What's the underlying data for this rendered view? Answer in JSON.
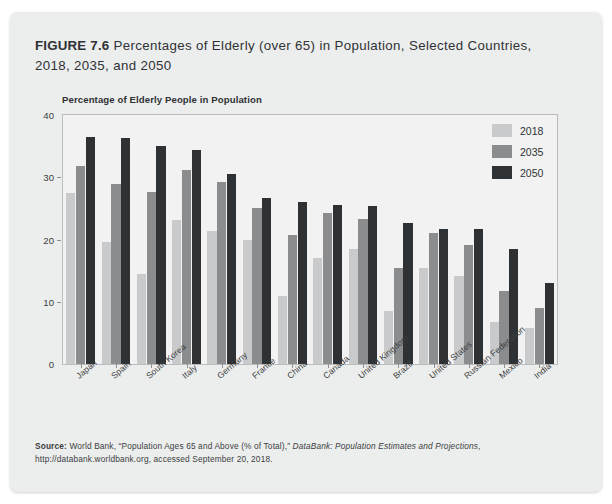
{
  "figure": {
    "label": "FIGURE 7.6",
    "title": " Percentages of Elderly (over 65) in Population, Selected Countries, 2018, 2035, and 2050"
  },
  "legend": {
    "position": "top-right",
    "entries": [
      {
        "label": "2018",
        "color": "#c9cacb"
      },
      {
        "label": "2035",
        "color": "#8a8c8e"
      },
      {
        "label": "2050",
        "color": "#2f3234"
      }
    ]
  },
  "source": {
    "prefix": "Source:",
    "line1a": " World Bank, “Population Ages 65 and Above (% of Total),” ",
    "line1_italic": "DataBank: Population Estimates and Projections",
    "line1b": ",",
    "line2": "http://databank.worldbank.org, accessed September 20, 2018."
  },
  "chart_data": {
    "type": "bar",
    "title": "Percentages of Elderly (over 65) in Population, Selected Countries, 2018, 2035, and 2050",
    "subtitle": "Percentage of Elderly People in Population",
    "xlabel": "",
    "ylabel": "Percentage of Elderly People in Population",
    "ylim": [
      0,
      40
    ],
    "yticks": [
      0,
      10,
      20,
      30,
      40
    ],
    "grid": false,
    "legend_position": "top-right",
    "categories": [
      "Japan",
      "Spain",
      "South Korea",
      "Italy",
      "Germany",
      "France",
      "China",
      "Canada",
      "United Kingdom",
      "Brazil",
      "United States",
      "Russian Federation",
      "Mexico",
      "India"
    ],
    "series": [
      {
        "name": "2018",
        "color": "#c9cacb",
        "values": [
          27.5,
          19.6,
          14.5,
          23.2,
          21.4,
          20.0,
          11.0,
          17.0,
          18.5,
          8.5,
          15.4,
          14.2,
          6.7,
          5.8
        ]
      },
      {
        "name": "2035",
        "color": "#8a8c8e",
        "values": [
          31.8,
          28.9,
          27.6,
          31.1,
          29.2,
          25.0,
          20.8,
          24.3,
          23.3,
          15.4,
          21.1,
          19.1,
          11.7,
          9.0
        ]
      },
      {
        "name": "2050",
        "color": "#2f3234",
        "values": [
          36.4,
          36.3,
          35.1,
          34.3,
          30.5,
          26.6,
          26.1,
          25.5,
          25.4,
          22.6,
          21.7,
          21.7,
          18.5,
          13.0
        ]
      }
    ]
  }
}
